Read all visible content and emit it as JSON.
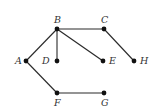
{
  "graph": {
    "nodes": [
      {
        "id": "A",
        "label": "A",
        "x": 26,
        "y": 61,
        "label_dx": -11,
        "label_dy": 3
      },
      {
        "id": "B",
        "label": "B",
        "x": 57,
        "y": 29,
        "label_dx": -3,
        "label_dy": -6
      },
      {
        "id": "C",
        "label": "C",
        "x": 104,
        "y": 29,
        "label_dx": -3,
        "label_dy": -6
      },
      {
        "id": "D",
        "label": "D",
        "x": 57,
        "y": 61,
        "label_dx": -15,
        "label_dy": 3
      },
      {
        "id": "E",
        "label": "E",
        "x": 103,
        "y": 61,
        "label_dx": 6,
        "label_dy": 3
      },
      {
        "id": "H",
        "label": "H",
        "x": 134,
        "y": 61,
        "label_dx": 6,
        "label_dy": 3
      },
      {
        "id": "F",
        "label": "F",
        "x": 57,
        "y": 93,
        "label_dx": -3,
        "label_dy": 13
      },
      {
        "id": "G",
        "label": "G",
        "x": 104,
        "y": 93,
        "label_dx": -3,
        "label_dy": 13
      }
    ],
    "edges": [
      [
        "A",
        "B"
      ],
      [
        "B",
        "D"
      ],
      [
        "B",
        "E"
      ],
      [
        "B",
        "C"
      ],
      [
        "C",
        "H"
      ],
      [
        "A",
        "F"
      ],
      [
        "F",
        "G"
      ]
    ],
    "colors": {
      "edge": "#2a2a2a",
      "node": "#111111",
      "label": "#333333",
      "background": "#ffffff"
    }
  }
}
